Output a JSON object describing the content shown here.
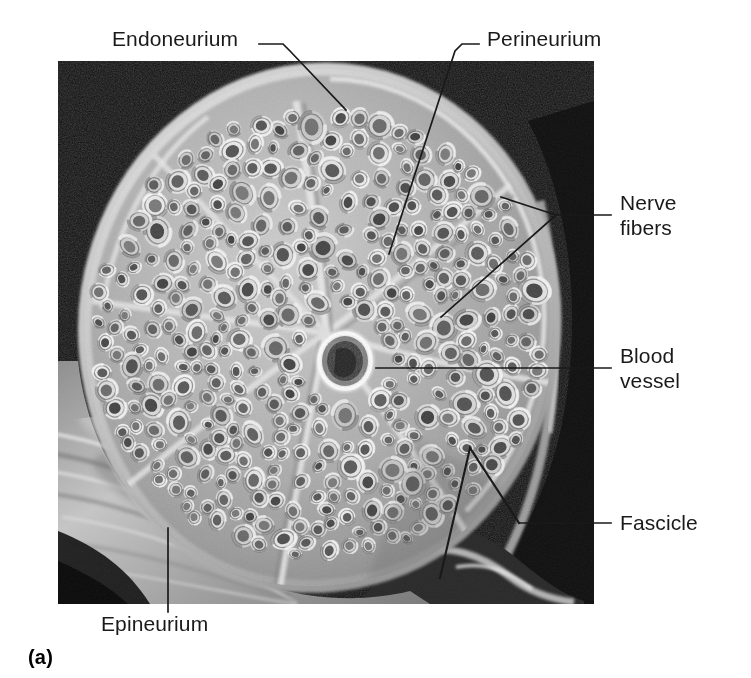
{
  "figure": {
    "panel_letter": "(a)",
    "image_kind": "scanning-electron-micrograph"
  },
  "labels": {
    "endoneurium": "Endoneurium",
    "perineurium": "Perineurium",
    "nerve_fibers": "Nerve\nfibers",
    "blood_vessel": "Blood\nvessel",
    "fascicle": "Fascicle",
    "epineurium": "Epineurium"
  },
  "colors": {
    "text": "#1a1a1a",
    "leader": "#1a1a1a",
    "page_background": "#ffffff",
    "micrograph_background": "#0a0a0a",
    "tissue_mid": "#9a9a9a",
    "tissue_light": "#d8d8d8",
    "tissue_dark": "#4a4a4a"
  },
  "micrograph": {
    "left": 58,
    "top": 61,
    "width": 536,
    "height": 543
  },
  "leaders": [
    {
      "name": "endoneurium",
      "points": "259,44 282,44 288,48 345,108"
    },
    {
      "name": "perineurium",
      "points": "479,44 463,44 457,48 390,253"
    },
    {
      "name": "nerve-fibers-upper",
      "points": "611,215 556,215 500,196"
    },
    {
      "name": "nerve-fibers-lower",
      "points": "611,215 556,215 440,316"
    },
    {
      "name": "blood-vessel",
      "points": "611,368 375,368"
    },
    {
      "name": "fascicle",
      "points": "611,523 518,523 473,449 443,577"
    },
    {
      "name": "epineurium",
      "points": "168,530 168,610"
    }
  ]
}
